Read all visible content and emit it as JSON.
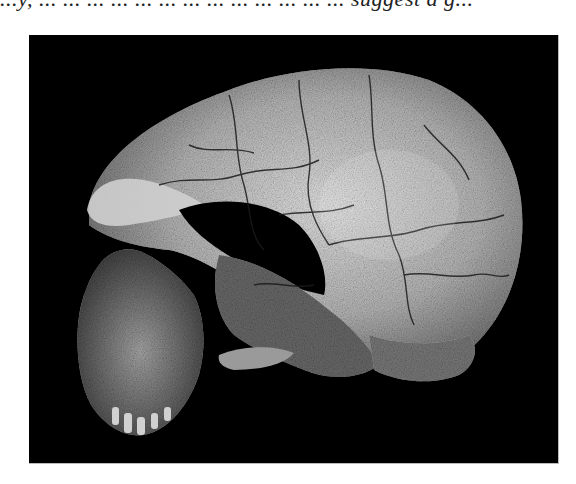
{
  "page": {
    "caption_fragment": "...y, ... ... ... ... ... ... ... ... ... ... ... ...  ... suggest a g...",
    "figure": {
      "subject": "fossil hominin skull, left lateral view",
      "background_color": "#000000",
      "bone_color_light": "#d8d8d8",
      "bone_color_dark": "#5a5a5a",
      "crack_color": "#1a1a1a"
    }
  }
}
